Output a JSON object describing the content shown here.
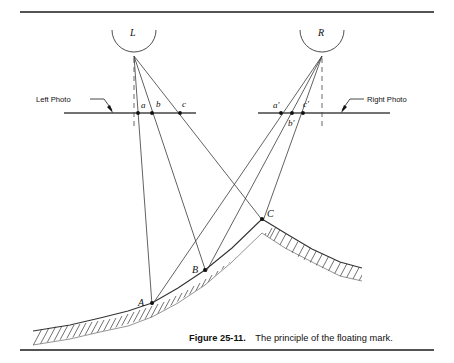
{
  "figure": {
    "caption_bold": "Figure 25-11.",
    "caption_text": "The principle of the floating mark.",
    "background_color": "#ffffff",
    "ink_color": "#111111"
  },
  "annotations": {
    "left_photo_label": "Left Photo",
    "right_photo_label": "Right Photo"
  },
  "cameras": [
    {
      "id": "L",
      "label": "L",
      "label_x": 133,
      "label_y": 34,
      "node_x": 134,
      "node_y": 56,
      "arc_cx": 134,
      "arc_cy": 30,
      "arc_r": 22
    },
    {
      "id": "R",
      "label": "R",
      "label_x": 321,
      "label_y": 34,
      "node_x": 322,
      "node_y": 56,
      "arc_cx": 322,
      "arc_cy": 30,
      "arc_r": 22
    }
  ],
  "photo_lines": [
    {
      "id": "left-photo",
      "x1": 64,
      "x2": 196,
      "y": 113
    },
    {
      "id": "right-photo",
      "x1": 258,
      "x2": 390,
      "y": 113
    }
  ],
  "image_points": [
    {
      "label": "a",
      "x": 138,
      "y": 113,
      "label_x": 142,
      "label_y": 108
    },
    {
      "label": "b",
      "x": 152,
      "y": 113,
      "label_x": 157,
      "label_y": 107
    },
    {
      "label": "c",
      "x": 180,
      "y": 113,
      "label_x": 183,
      "label_y": 107
    },
    {
      "label": "a'",
      "x": 281,
      "y": 113,
      "label_x": 275,
      "label_y": 108
    },
    {
      "label": "b'",
      "x": 292,
      "y": 113,
      "label_x": 291,
      "label_y": 125
    },
    {
      "label": "c'",
      "x": 303,
      "y": 113,
      "label_x": 304,
      "label_y": 108
    }
  ],
  "ground_points": [
    {
      "label": "A",
      "x": 152,
      "y": 303,
      "label_x": 140,
      "label_y": 303
    },
    {
      "label": "B",
      "x": 205,
      "y": 270,
      "label_x": 194,
      "label_y": 270
    },
    {
      "label": "C",
      "x": 262,
      "y": 219,
      "label_x": 268,
      "label_y": 216
    }
  ],
  "rays": [
    {
      "from": "L",
      "to": "A",
      "x1": 134,
      "y1": 56,
      "x2": 152,
      "y2": 303
    },
    {
      "from": "L",
      "to": "B",
      "x1": 134,
      "y1": 56,
      "x2": 205,
      "y2": 270
    },
    {
      "from": "L",
      "to": "C",
      "x1": 134,
      "y1": 56,
      "x2": 262,
      "y2": 219
    },
    {
      "from": "R",
      "to": "A",
      "x1": 322,
      "y1": 56,
      "x2": 152,
      "y2": 303
    },
    {
      "from": "R",
      "to": "B",
      "x1": 322,
      "y1": 56,
      "x2": 205,
      "y2": 270
    },
    {
      "from": "R",
      "to": "C",
      "x1": 322,
      "y1": 56,
      "x2": 262,
      "y2": 219
    }
  ],
  "optical_axes": [
    {
      "id": "left-axis",
      "x": 134,
      "y1": 56,
      "y2": 125
    },
    {
      "id": "right-axis",
      "x": 322,
      "y1": 56,
      "y2": 125
    }
  ],
  "rules": [
    {
      "id": "top-rule",
      "x1": 20,
      "x2": 434,
      "y": 12
    },
    {
      "id": "bottom-rule",
      "x1": 20,
      "x2": 434,
      "y": 350
    }
  ],
  "leaders": {
    "left": {
      "text_x": 35,
      "text_y": 102,
      "lx1": 92,
      "ly1": 100,
      "lx2": 105,
      "ly2": 113
    },
    "right": {
      "text_x": 355,
      "text_y": 102,
      "lx1": 352,
      "ly1": 100,
      "lx2": 338,
      "ly2": 113
    }
  },
  "terrain": {
    "description": "hatched ground profile rising left-to-right to a peak at C then descending right",
    "path": "M 33,331 L 100,318 L 152,303 L 205,270 L 262,219 L 300,243 L 340,262 L 360,268"
  },
  "caption_position": {
    "x": 189,
    "y": 340
  }
}
